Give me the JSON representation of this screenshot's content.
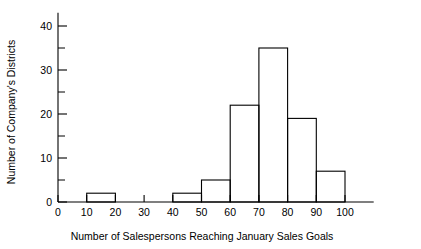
{
  "chart_data": {
    "type": "bar",
    "title": "",
    "subtitle": "",
    "xlabel": "Number of Salespersons Reaching January Sales Goals",
    "ylabel": "Number of Company's Districts",
    "categories": [
      "0-10",
      "10-20",
      "20-30",
      "30-40",
      "40-50",
      "50-60",
      "60-70",
      "70-80",
      "80-90",
      "90-100"
    ],
    "bin_edges": [
      0,
      10,
      20,
      30,
      40,
      50,
      60,
      70,
      80,
      90,
      100
    ],
    "values": [
      0,
      2,
      0,
      0,
      2,
      5,
      22,
      35,
      19,
      7
    ],
    "xlim": [
      0,
      110
    ],
    "ylim": [
      0,
      43
    ],
    "x_ticks": [
      0,
      10,
      20,
      30,
      40,
      50,
      60,
      70,
      80,
      90,
      100
    ],
    "x_tick_labels": [
      "0",
      "10",
      "20",
      "30",
      "40",
      "50",
      "60",
      "70",
      "80",
      "90",
      "100"
    ],
    "y_ticks": [
      0,
      10,
      20,
      30,
      40
    ],
    "y_tick_labels": [
      "0",
      "10",
      "20",
      "30",
      "40"
    ],
    "y_minor_ticks": [
      5,
      15,
      25,
      35
    ],
    "grid": false,
    "legend": false,
    "legend_position": "none",
    "bar_fill": "#ffffff",
    "bar_stroke": "#000000",
    "axis_color": "#000000",
    "background": "#ffffff"
  }
}
